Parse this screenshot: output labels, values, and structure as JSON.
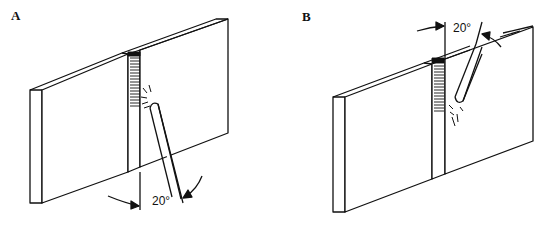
{
  "figure": {
    "panels": [
      {
        "label": "A",
        "angle_text": "20°",
        "description": "Electrode tilted 20° from vertical, welding upward (butt joint between two plates)"
      },
      {
        "label": "B",
        "angle_text": "20°",
        "description": "Electrode tilted 20° from vertical, welding downward (butt joint between two plates)"
      }
    ],
    "colors": {
      "line": "#111111",
      "background": "#ffffff"
    }
  }
}
